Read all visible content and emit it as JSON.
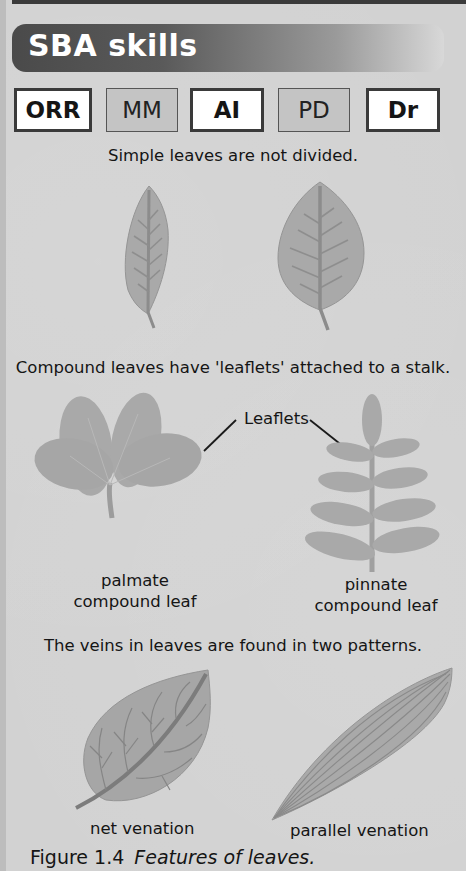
{
  "header": {
    "title": "SBA skills"
  },
  "skills": [
    {
      "code": "ORR",
      "active": true
    },
    {
      "code": "MM",
      "active": false
    },
    {
      "code": "AI",
      "active": true
    },
    {
      "code": "PD",
      "active": false
    },
    {
      "code": "Dr",
      "active": true
    }
  ],
  "sections": {
    "simple": {
      "caption": "Simple leaves are not divided."
    },
    "compound": {
      "caption": "Compound leaves have 'leaflets' attached to a stalk.",
      "leaflets_label": "Leaflets",
      "palmate": {
        "line1": "palmate",
        "line2": "compound leaf"
      },
      "pinnate": {
        "line1": "pinnate",
        "line2": "compound leaf"
      }
    },
    "venation": {
      "caption": "The veins in leaves are found in two patterns.",
      "net_label": "net venation",
      "parallel_label": "parallel venation"
    }
  },
  "figure": {
    "number": "Figure 1.4",
    "title": "Features of leaves."
  },
  "colors": {
    "leaf_fill": "#a8a8a8",
    "leaf_vein": "#8a8a8a",
    "banner_dark": "#4a4a4a",
    "background": "#d2d2d2"
  }
}
